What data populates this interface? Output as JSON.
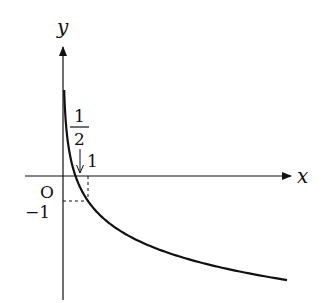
{
  "diagram": {
    "type": "function-graph",
    "function": "y = log_{1/2}(2x)",
    "axes": {
      "x_label": "x",
      "y_label": "y",
      "origin_label": "O"
    },
    "annotations": {
      "x_intercept_numerator": "1",
      "x_intercept_denominator": "2",
      "tick_x_one": "1",
      "tick_y_minus_one": "−1"
    },
    "key_points": [
      {
        "x": 0.5,
        "y": 0,
        "label": "1/2"
      },
      {
        "x": 1,
        "y": -1,
        "label": "(1, −1)"
      }
    ],
    "colors": {
      "stroke": "#111111",
      "background": "#ffffff"
    }
  }
}
